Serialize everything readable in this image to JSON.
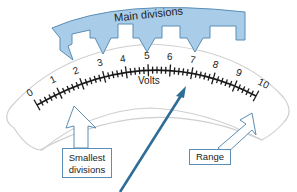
{
  "diagram": {
    "title_callout": "Main divisions",
    "unit_label": "Volts",
    "scale": {
      "min": 0,
      "max": 10,
      "main_divisions": [
        "0",
        "1",
        "2",
        "3",
        "4",
        "5",
        "6",
        "7",
        "8",
        "9",
        "10"
      ],
      "minor_ticks_per_division": 4
    },
    "callouts": {
      "main_divisions": "Main divisions",
      "smallest_divisions_line1": "Smallest",
      "smallest_divisions_line2": "divisions",
      "range": "Range"
    },
    "colors": {
      "callout_fill": "#a9cde8",
      "callout_stroke": "#5b8db5",
      "needle": "#2f6d96",
      "scale_ink": "#1a1a1a",
      "dial_outline": "#c8c8c8"
    }
  }
}
